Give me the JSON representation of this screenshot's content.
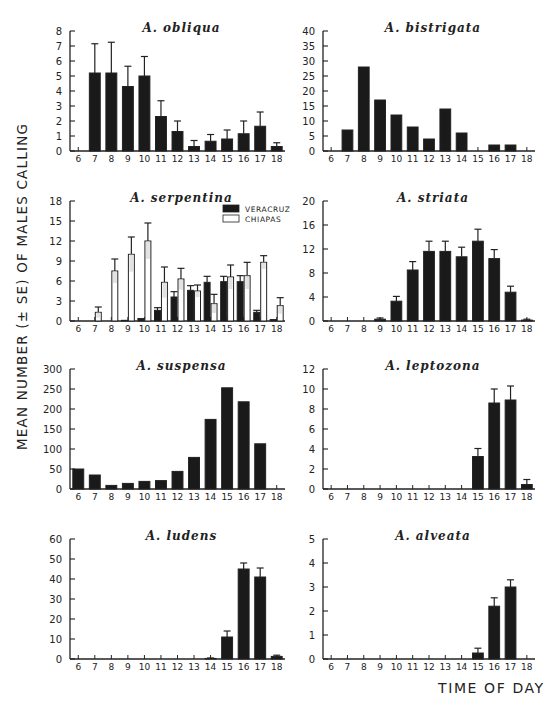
{
  "figure": {
    "ylabel": "MEAN NUMBER (± SE) OF MALES CALLING",
    "xlabel": "TIME OF DAY",
    "colors": {
      "bar_dark": "#1a1a1a",
      "bar_light": "#ffffff",
      "axis": "#222222"
    }
  },
  "chart_data": [
    {
      "type": "bar",
      "title": "A. obliqua",
      "xlabel": "",
      "ylabel": "",
      "categories": [
        "6",
        "7",
        "8",
        "9",
        "10",
        "11",
        "12",
        "13",
        "14",
        "15",
        "16",
        "17",
        "18"
      ],
      "series": [
        {
          "name": "A. obliqua",
          "values": [
            0,
            5.2,
            5.2,
            4.3,
            5.0,
            2.3,
            1.3,
            0.3,
            0.65,
            0.8,
            1.15,
            1.65,
            0.3
          ],
          "se_upper": [
            0,
            7.15,
            7.25,
            5.65,
            6.3,
            3.35,
            2.0,
            0.7,
            1.1,
            1.4,
            2.0,
            2.6,
            0.55
          ]
        }
      ],
      "ylim": [
        0,
        8
      ],
      "yticks": [
        0,
        1,
        2,
        3,
        4,
        5,
        6,
        7,
        8
      ],
      "grid": false,
      "legend": null
    },
    {
      "type": "bar",
      "title": "A. bistrigata",
      "xlabel": "",
      "ylabel": "",
      "categories": [
        "6",
        "7",
        "8",
        "9",
        "10",
        "11",
        "12",
        "13",
        "14",
        "15",
        "16",
        "17",
        "18"
      ],
      "series": [
        {
          "name": "A. bistrigata",
          "values": [
            0,
            7,
            28,
            17,
            12,
            8,
            4,
            14,
            6,
            0,
            2,
            2,
            0
          ],
          "se_upper": null
        }
      ],
      "ylim": [
        0,
        40
      ],
      "yticks": [
        0,
        5,
        10,
        15,
        20,
        25,
        30,
        35,
        40
      ],
      "grid": false,
      "legend": null
    },
    {
      "type": "bar",
      "title": "A. serpentina",
      "xlabel": "",
      "ylabel": "",
      "categories": [
        "6",
        "7",
        "8",
        "9",
        "10",
        "11",
        "12",
        "13",
        "14",
        "15",
        "16",
        "17",
        "18"
      ],
      "series": [
        {
          "name": "VERACRUZ",
          "color": "#1a1a1a",
          "values": [
            0,
            0,
            0,
            0.1,
            0.3,
            1.6,
            3.6,
            4.6,
            5.8,
            5.9,
            5.9,
            1.3,
            0.15
          ],
          "se_upper": [
            0,
            0,
            0,
            0.1,
            0.35,
            2.0,
            4.4,
            5.3,
            6.7,
            6.7,
            6.8,
            1.6,
            0.2
          ]
        },
        {
          "name": "CHIAPAS",
          "color": "#ffffff",
          "values": [
            0,
            1.3,
            7.5,
            10.0,
            12.0,
            5.8,
            6.3,
            4.5,
            2.6,
            6.6,
            6.8,
            8.8,
            2.3
          ],
          "se_upper": [
            0,
            2.1,
            9.3,
            12.6,
            14.7,
            8.1,
            7.9,
            5.4,
            4.0,
            8.4,
            8.8,
            9.8,
            3.5
          ]
        }
      ],
      "ylim": [
        0,
        18
      ],
      "yticks": [
        0,
        3,
        6,
        9,
        12,
        15,
        18
      ],
      "grid": false,
      "legend": {
        "position": "upper right",
        "entries": [
          "VERACRUZ",
          "CHIAPAS"
        ]
      }
    },
    {
      "type": "bar",
      "title": "A. striata",
      "xlabel": "",
      "ylabel": "",
      "categories": [
        "6",
        "7",
        "8",
        "9",
        "10",
        "11",
        "12",
        "13",
        "14",
        "15",
        "16",
        "17",
        "18"
      ],
      "series": [
        {
          "name": "A. striata",
          "values": [
            0,
            0,
            0,
            0.3,
            3.3,
            8.5,
            11.6,
            11.6,
            10.7,
            13.3,
            10.4,
            4.8,
            0.15
          ],
          "se_upper": [
            0,
            0,
            0,
            0.5,
            4.1,
            9.9,
            13.3,
            13.3,
            12.3,
            15.3,
            11.9,
            5.8,
            0.3
          ]
        }
      ],
      "ylim": [
        0,
        20
      ],
      "yticks": [
        0,
        4,
        8,
        12,
        16,
        20
      ],
      "grid": false,
      "legend": null
    },
    {
      "type": "bar",
      "title": "A. suspensa",
      "xlabel": "",
      "ylabel": "",
      "categories": [
        "6",
        "7",
        "8",
        "9",
        "10",
        "11",
        "12",
        "13",
        "14",
        "15",
        "16",
        "17",
        "18"
      ],
      "series": [
        {
          "name": "A. suspensa",
          "values": [
            50,
            35,
            9,
            14,
            19,
            21,
            44,
            79,
            174,
            253,
            218,
            113,
            0
          ],
          "se_upper": null
        }
      ],
      "ylim": [
        0,
        300
      ],
      "yticks": [
        0,
        50,
        100,
        150,
        200,
        250,
        300
      ],
      "grid": false,
      "legend": null
    },
    {
      "type": "bar",
      "title": "A. leptozona",
      "xlabel": "",
      "ylabel": "",
      "categories": [
        "6",
        "7",
        "8",
        "9",
        "10",
        "11",
        "12",
        "13",
        "14",
        "15",
        "16",
        "17",
        "18"
      ],
      "series": [
        {
          "name": "A. leptozona",
          "values": [
            0,
            0,
            0,
            0,
            0,
            0,
            0,
            0,
            0,
            3.25,
            8.6,
            8.9,
            0.45
          ],
          "se_upper": [
            0,
            0,
            0,
            0,
            0,
            0,
            0,
            0,
            0,
            4.05,
            10.0,
            10.3,
            0.95
          ]
        }
      ],
      "ylim": [
        0,
        12
      ],
      "yticks": [
        0,
        2,
        4,
        6,
        8,
        10,
        12
      ],
      "grid": false,
      "legend": null
    },
    {
      "type": "bar",
      "title": "A. ludens",
      "xlabel": "",
      "ylabel": "",
      "categories": [
        "6",
        "7",
        "8",
        "9",
        "10",
        "11",
        "12",
        "13",
        "14",
        "15",
        "16",
        "17",
        "18"
      ],
      "series": [
        {
          "name": "A. ludens",
          "values": [
            0,
            0,
            0,
            0,
            0,
            0,
            0,
            0,
            0.3,
            11,
            45,
            41,
            1.3
          ],
          "se_upper": [
            0,
            0,
            0,
            0,
            0,
            0,
            0,
            0,
            0.5,
            14,
            48,
            45.5,
            1.9
          ]
        }
      ],
      "ylim": [
        0,
        60
      ],
      "yticks": [
        0,
        10,
        20,
        30,
        40,
        50,
        60
      ],
      "grid": false,
      "legend": null
    },
    {
      "type": "bar",
      "title": "A. alveata",
      "xlabel": "TIME OF DAY",
      "ylabel": "",
      "categories": [
        "6",
        "7",
        "8",
        "9",
        "10",
        "11",
        "12",
        "13",
        "14",
        "15",
        "16",
        "17",
        "18"
      ],
      "series": [
        {
          "name": "A. alveata",
          "values": [
            0,
            0,
            0,
            0,
            0,
            0,
            0,
            0,
            0,
            0.25,
            2.2,
            3.0,
            0
          ],
          "se_upper": [
            0,
            0,
            0,
            0,
            0,
            0,
            0,
            0,
            0,
            0.45,
            2.55,
            3.3,
            0
          ]
        }
      ],
      "ylim": [
        0,
        5
      ],
      "yticks": [
        0,
        1,
        2,
        3,
        4,
        5
      ],
      "grid": false,
      "legend": null
    }
  ]
}
